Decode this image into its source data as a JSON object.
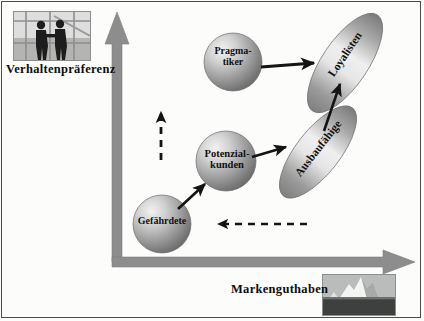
{
  "diagram": {
    "axes": {
      "vertical_label": "Verhaltenpräferenz",
      "horizontal_label": "Markenguthaben",
      "axis_color": "#8d8d8d"
    },
    "images": [
      {
        "name": "handshake-photo",
        "alt": "Zwei Personen beim Händedruck vor einem Fenster"
      },
      {
        "name": "iceberg-photo",
        "alt": "Eisberg im Meer"
      }
    ],
    "nodes": [
      {
        "id": "pragmatiker",
        "label": "Pragma-\ntiker",
        "line1": "Pragma-",
        "line2": "tiker",
        "shape": "circle"
      },
      {
        "id": "loyalisten",
        "label": "Loyalisten",
        "line1": "Loyalisten",
        "line2": "",
        "shape": "ellipse"
      },
      {
        "id": "potenzial",
        "label": "Potenzial-\nkunden",
        "line1": "Potenzial-",
        "line2": "kunden",
        "shape": "circle"
      },
      {
        "id": "ausbaufaehige",
        "label": "Ausbaufähige",
        "line1": "Ausbaufähige",
        "line2": "",
        "shape": "ellipse"
      },
      {
        "id": "gefaehrdete",
        "label": "Gefährdete",
        "line1": "Gefährdete",
        "line2": "",
        "shape": "circle"
      }
    ],
    "arrows": [
      {
        "name": "gefaehrdete-to-potenzial",
        "style": "solid",
        "from": "gefaehrdete",
        "to": "potenzial"
      },
      {
        "name": "potenzial-to-ausbaufaehige",
        "style": "solid",
        "from": "potenzial",
        "to": "ausbaufaehige"
      },
      {
        "name": "pragmatiker-to-loyalisten",
        "style": "solid",
        "from": "pragmatiker",
        "to": "loyalisten"
      },
      {
        "name": "ausbaufaehige-to-loyalisten",
        "style": "solid",
        "from": "ausbaufaehige",
        "to": "loyalisten"
      },
      {
        "name": "downgrade-vertical",
        "style": "dashed",
        "from": "",
        "to": ""
      },
      {
        "name": "downgrade-horizontal",
        "style": "dashed",
        "from": "",
        "to": ""
      }
    ],
    "colors": {
      "node_fill_light": "#e9e9e9",
      "node_fill_dark": "#6f6f6f",
      "axis": "#8d8d8d",
      "arrow": "#141414",
      "border": "#4a4a4a"
    }
  }
}
